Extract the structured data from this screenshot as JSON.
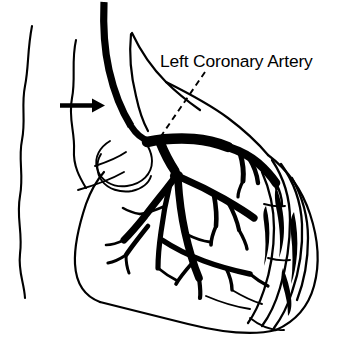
{
  "figure": {
    "kind": "medical-line-illustration",
    "background_color": "#ffffff",
    "ink_color": "#000000",
    "width": 348,
    "height": 351
  },
  "labels": {
    "artery_label": "Left Coronary Artery"
  },
  "annotations": {
    "leader_line": {
      "style": "dashed",
      "from_label_x": 205,
      "from_label_y": 72,
      "to_artery_x": 157,
      "to_artery_y": 142
    },
    "arrow": {
      "direction": "right",
      "points_to": "catheter",
      "tip_x": 104,
      "tip_y": 105
    }
  },
  "structures": {
    "torso_outline": "two wavy vertical body-wall lines at left",
    "catheter": "thick black curved catheter entering from top",
    "heart_outline": "left-lateral heart silhouette",
    "atrial_appendage": "rounded lobe at upper left of heart",
    "coronary_arteries": "stippled branching arterial tree",
    "bifurcation_node": "solid black node at main artery branch point",
    "cardiac_veins": "wavy outlined vessels along right heart border"
  }
}
